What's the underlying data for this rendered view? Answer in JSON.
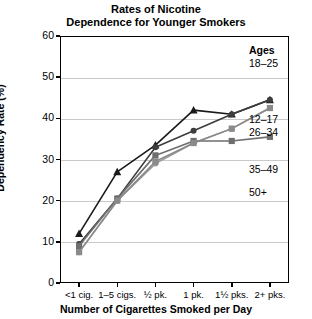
{
  "chart_data": {
    "type": "line",
    "title": "Rates of Nicotine Dependence for Younger Smokers",
    "title_lines": [
      "Rates of Nicotine",
      "Dependence for Younger Smokers"
    ],
    "xlabel": "Number of Cigarettes Smoked per Day",
    "ylabel": "Dependency Rate (%)",
    "categories": [
      "<1 cig.",
      "1–5 cigs.",
      "½ pk.",
      "1 pk.",
      "1½ pks.",
      "2+ pks."
    ],
    "ylim": [
      0,
      60
    ],
    "yticks": [
      0,
      10,
      20,
      30,
      40,
      50,
      60
    ],
    "grid": true,
    "legend_position": "right",
    "legend_title": "Ages",
    "series": [
      {
        "name": "18–25",
        "marker": "circle",
        "color": "#9a9a9a",
        "values": [
          7.5,
          20.0,
          29.0,
          34.0,
          37.5,
          42.5
        ]
      },
      {
        "name": "12–17",
        "marker": "triangle",
        "color": "#1a1a1a",
        "values": [
          12.0,
          27.0,
          33.5,
          42.0,
          41.0,
          44.5
        ]
      },
      {
        "name": "26–34",
        "marker": "circle",
        "color": "#3d3d3d",
        "values": [
          9.5,
          20.5,
          33.0,
          37.0,
          41.0,
          44.5
        ]
      },
      {
        "name": "35–49",
        "marker": "square",
        "color": "#6e6e6e",
        "values": [
          9.0,
          20.5,
          31.0,
          34.5,
          34.5,
          35.5
        ]
      },
      {
        "name": "50+",
        "marker": "square",
        "color": "#8a8a8a",
        "values": [
          7.5,
          20.0,
          29.5,
          34.0,
          37.5,
          42.5
        ]
      }
    ]
  },
  "legend": {
    "title": "Ages",
    "entries": [
      "18–25",
      "12–17",
      "26–34",
      "35–49",
      "50+"
    ]
  }
}
